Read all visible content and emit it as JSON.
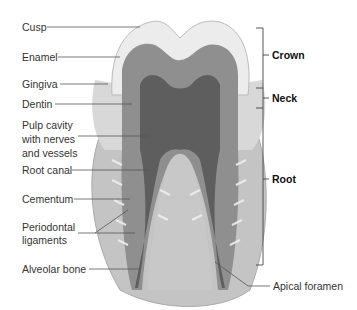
{
  "figure": {
    "left_labels": [
      {
        "id": "cusp",
        "text": "Cusp"
      },
      {
        "id": "enamel",
        "text": "Enamel"
      },
      {
        "id": "gingiva",
        "text": "Gingiva"
      },
      {
        "id": "dentin",
        "text": "Dentin"
      },
      {
        "id": "pulp",
        "text": "Pulp cavity\nwith nerves\nand vessels",
        "lines": [
          "Pulp cavity",
          "with nerves",
          "and vessels"
        ]
      },
      {
        "id": "root_canal",
        "text": "Root canal"
      },
      {
        "id": "cementum",
        "text": "Cementum"
      },
      {
        "id": "periodontal",
        "text": "Periodontal ligaments",
        "lines": [
          "Periodontal",
          "ligaments"
        ]
      },
      {
        "id": "alveolar",
        "text": "Alveolar bone"
      }
    ],
    "right_labels": [
      {
        "id": "apical",
        "text": "Apical foramen"
      }
    ],
    "regions": [
      {
        "id": "crown",
        "text": "Crown"
      },
      {
        "id": "neck",
        "text": "Neck"
      },
      {
        "id": "root",
        "text": "Root"
      }
    ],
    "colors": {
      "line": "#555555",
      "bone": "#bdbdbd",
      "dentin": "#8f8f8f",
      "pulp": "#6e6e6e",
      "enamel": "#e9e9e9",
      "gum": "#d6d6d6"
    }
  }
}
